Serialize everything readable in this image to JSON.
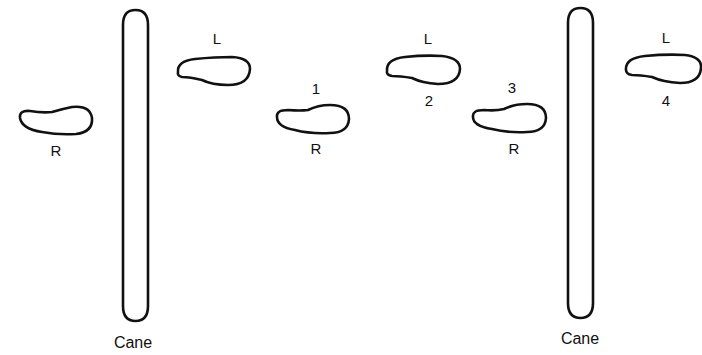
{
  "diagram": {
    "canes": [
      {
        "label": "Cane",
        "x": 122,
        "y": 10,
        "w": 27,
        "h": 311,
        "label_x": 138,
        "label_y": 327
      },
      {
        "label": "Cane",
        "x": 567,
        "y": 8,
        "w": 27,
        "h": 310,
        "label_x": 583,
        "label_y": 323
      }
    ],
    "footprints": [
      {
        "side": "R",
        "step": "",
        "x": 18,
        "y": 106,
        "w": 75,
        "h": 29,
        "side_label_pos": "below"
      },
      {
        "side": "L",
        "step": "",
        "x": 177,
        "y": 56,
        "w": 73,
        "h": 30,
        "side_label_pos": "above"
      },
      {
        "side": "R",
        "step": "1",
        "x": 276,
        "y": 105,
        "w": 74,
        "h": 28,
        "side_label_pos": "below"
      },
      {
        "side": "L",
        "step": "2",
        "x": 386,
        "y": 55,
        "w": 74,
        "h": 30,
        "side_label_pos": "above"
      },
      {
        "side": "R",
        "step": "3",
        "x": 472,
        "y": 103,
        "w": 75,
        "h": 30,
        "side_label_pos": "below"
      },
      {
        "side": "L",
        "step": "4",
        "x": 625,
        "y": 54,
        "w": 76,
        "h": 30,
        "side_label_pos": "above"
      }
    ],
    "labels": {
      "r0": "R",
      "l0": "L",
      "step1": "1",
      "r1": "R",
      "l2": "L",
      "step2": "2",
      "step3": "3",
      "r3": "R",
      "l4": "L",
      "step4": "4",
      "cane_left": "Cane",
      "cane_right": "Cane"
    },
    "stroke_color": "#111111",
    "background": "#ffffff"
  }
}
